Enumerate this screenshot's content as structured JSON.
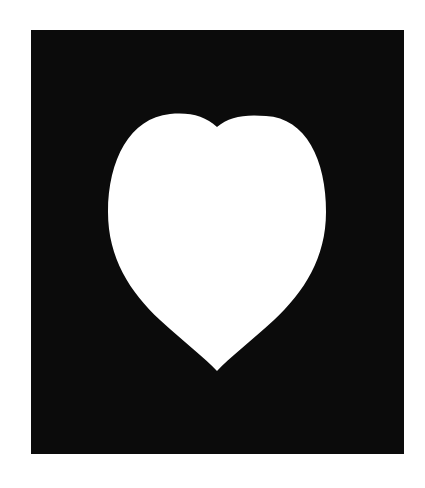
{
  "image": {
    "description": "White heart cut-out centered on a black rectangular mat",
    "background_color": "#ffffff",
    "mat_color": "#0b0b0b",
    "heart_color": "#ffffff",
    "shapes": [
      {
        "name": "mat",
        "type": "rectangle"
      },
      {
        "name": "heart",
        "type": "heart"
      }
    ]
  }
}
